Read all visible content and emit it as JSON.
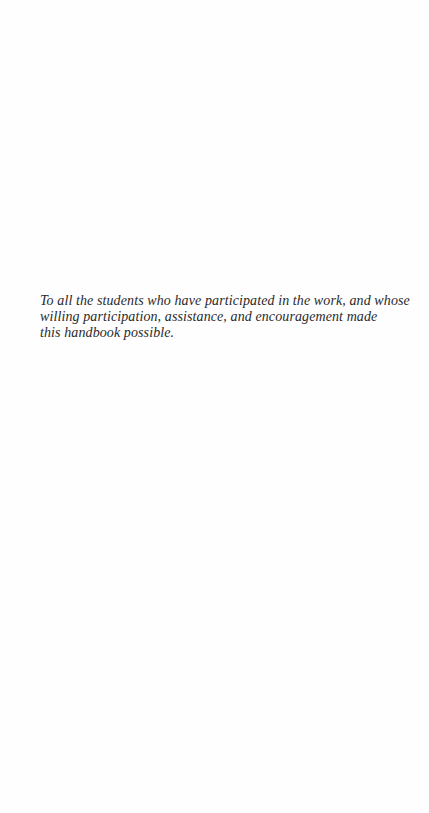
{
  "dedication": {
    "lines": [
      "To all the students who have participated in the work, and whose",
      "willing participation, assistance, and encouragement made",
      "this handbook possible."
    ]
  }
}
